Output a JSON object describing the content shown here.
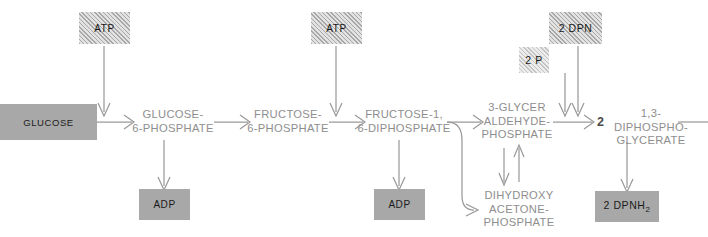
{
  "diagram": {
    "type": "metabolic-pathway-flow",
    "colors": {
      "solid_box_fill": "#a8a8a8",
      "hatched_box_fill": "#e2e2e2",
      "light_hatched_box_fill": "#ececec",
      "chain_label_text": "#8e8e8e",
      "box_label_text": "#1a1a1a",
      "arrow_stroke": "#9a9a9a",
      "background": "#ffffff"
    },
    "chain": [
      {
        "id": "glucose",
        "label": "GLUCOSE",
        "style": "solid-box"
      },
      {
        "id": "g6p",
        "label": "GLUCOSE-\n6-PHOSPHATE",
        "style": "plain-text"
      },
      {
        "id": "f6p",
        "label": "FRUCTOSE-\n6-PHOSPHATE",
        "style": "plain-text"
      },
      {
        "id": "f16dp",
        "label": "FRUCTOSE-1,\n6-DIPHOSPHATE",
        "style": "plain-text"
      },
      {
        "id": "g3p",
        "label": "3-GLYCER\nALDEHYDE-\nPHOSPHATE",
        "style": "plain-text"
      },
      {
        "id": "dpg",
        "label": "1,3-DIPHOSPHO-\nGLYCERATE",
        "style": "plain-text",
        "coefficient": "2"
      }
    ],
    "branch": {
      "id": "dhap",
      "label": "DIHYDROXY\nACETONE-\nPHOSPHATE",
      "style": "plain-text",
      "reversible_with": "g3p"
    },
    "inputs": [
      {
        "id": "atp-1",
        "label": "ATP",
        "style": "hatched-box",
        "target": "g6p"
      },
      {
        "id": "atp-2",
        "label": "ATP",
        "style": "hatched-box",
        "target": "f16dp"
      },
      {
        "id": "dpn",
        "label": "2 DPN",
        "style": "hatched-box",
        "target": "dpg"
      },
      {
        "id": "pi",
        "label": "2 P",
        "style": "light-hatched-box",
        "target": "dpg"
      }
    ],
    "outputs": [
      {
        "id": "adp-1",
        "label": "ADP",
        "style": "solid-box",
        "source": "g6p"
      },
      {
        "id": "adp-2",
        "label": "ADP",
        "style": "solid-box",
        "source": "f16dp"
      },
      {
        "id": "dpnh2",
        "label": "2 DPNH",
        "subscript": "2",
        "style": "solid-box",
        "source": "dpg"
      }
    ],
    "continues_right": true
  }
}
